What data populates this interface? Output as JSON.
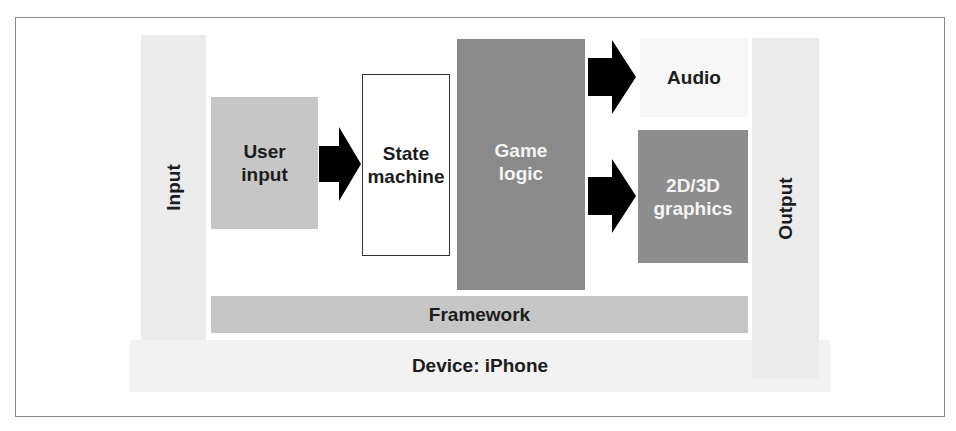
{
  "diagram": {
    "colors": {
      "light_column": "#ebebeb",
      "device_band": "#f2f2f2",
      "medium_gray": "#c6c6c6",
      "dark_gray": "#8a8a8a",
      "arrow": "#000000",
      "frame_border": "#8a8a8a"
    },
    "nodes": {
      "input": "Input",
      "user_input": "User input",
      "state_machine": "State machine",
      "game_logic": "Game logic",
      "audio": "Audio",
      "graphics": "2D/3D graphics",
      "output": "Output",
      "framework": "Framework",
      "device": "Device: iPhone"
    },
    "edges": [
      {
        "from": "User input",
        "to": "State machine",
        "icon": "right-arrow-icon"
      },
      {
        "from": "Game logic",
        "to": "Audio",
        "icon": "right-arrow-icon"
      },
      {
        "from": "Game logic",
        "to": "2D/3D graphics",
        "icon": "right-arrow-icon"
      }
    ]
  }
}
